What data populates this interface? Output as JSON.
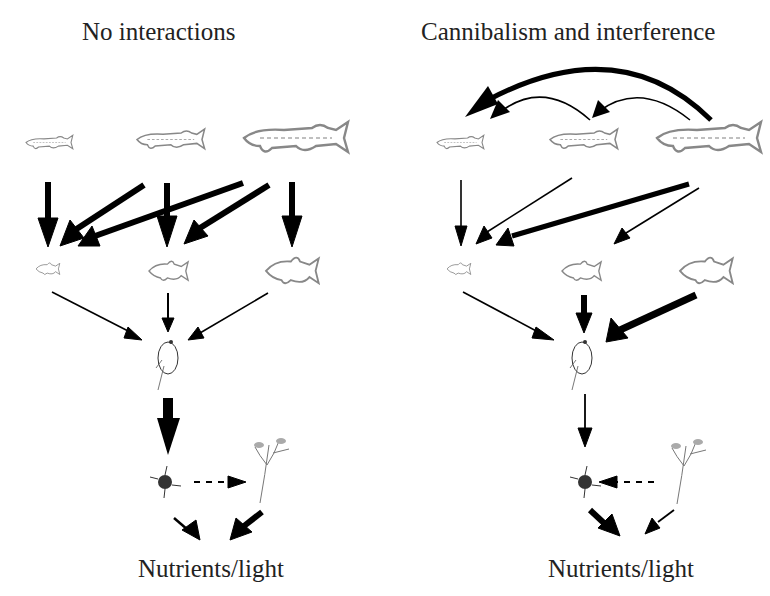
{
  "panels": [
    {
      "title": "No interactions",
      "bottom_label": "Nutrients/light",
      "nodes": {
        "pike": [
          "small pike",
          "medium pike",
          "large pike"
        ],
        "prey_fish": [
          "small prey fish",
          "medium prey fish",
          "large prey fish"
        ],
        "zooplankton": "daphnia",
        "phytoplankton": "algae",
        "macrophyte": "plant"
      },
      "edges": [
        {
          "from": "small pike",
          "to": "small prey fish",
          "weight": "thick"
        },
        {
          "from": "medium pike",
          "to": "small prey fish",
          "weight": "thick"
        },
        {
          "from": "medium pike",
          "to": "medium prey fish",
          "weight": "thick"
        },
        {
          "from": "large pike",
          "to": "small prey fish",
          "weight": "thick"
        },
        {
          "from": "large pike",
          "to": "medium prey fish",
          "weight": "thick"
        },
        {
          "from": "large pike",
          "to": "large prey fish",
          "weight": "thick"
        },
        {
          "from": "small prey fish",
          "to": "daphnia",
          "weight": "thin"
        },
        {
          "from": "medium prey fish",
          "to": "daphnia",
          "weight": "thin"
        },
        {
          "from": "large prey fish",
          "to": "daphnia",
          "weight": "thin"
        },
        {
          "from": "daphnia",
          "to": "algae",
          "weight": "very thick"
        },
        {
          "from": "algae",
          "to": "plant",
          "weight": "dashed"
        },
        {
          "from": "algae",
          "to": "nutrients",
          "weight": "medium"
        },
        {
          "from": "plant",
          "to": "nutrients",
          "weight": "thick"
        }
      ]
    },
    {
      "title": "Cannibalism and interference",
      "bottom_label": "Nutrients/light",
      "nodes": {
        "pike": [
          "small pike",
          "medium pike",
          "large pike"
        ],
        "prey_fish": [
          "small prey fish",
          "medium prey fish",
          "large prey fish"
        ],
        "zooplankton": "daphnia",
        "phytoplankton": "algae",
        "macrophyte": "plant"
      },
      "edges": [
        {
          "from": "large pike",
          "to": "small pike",
          "weight": "thick",
          "type": "cannibalism"
        },
        {
          "from": "medium pike",
          "to": "small pike",
          "weight": "thin",
          "type": "cannibalism"
        },
        {
          "from": "large pike",
          "to": "medium pike",
          "weight": "thin",
          "type": "cannibalism"
        },
        {
          "from": "small pike",
          "to": "small prey fish",
          "weight": "thin"
        },
        {
          "from": "medium pike",
          "to": "small prey fish",
          "weight": "thin"
        },
        {
          "from": "large pike",
          "to": "small prey fish",
          "weight": "thick"
        },
        {
          "from": "large pike",
          "to": "medium prey fish",
          "weight": "thin"
        },
        {
          "from": "small prey fish",
          "to": "daphnia",
          "weight": "thin"
        },
        {
          "from": "medium prey fish",
          "to": "daphnia",
          "weight": "thick"
        },
        {
          "from": "large prey fish",
          "to": "daphnia",
          "weight": "very thick"
        },
        {
          "from": "daphnia",
          "to": "algae",
          "weight": "thin"
        },
        {
          "from": "plant",
          "to": "algae",
          "weight": "dashed"
        },
        {
          "from": "algae",
          "to": "nutrients",
          "weight": "thick"
        },
        {
          "from": "plant",
          "to": "nutrients",
          "weight": "thin"
        }
      ]
    }
  ]
}
